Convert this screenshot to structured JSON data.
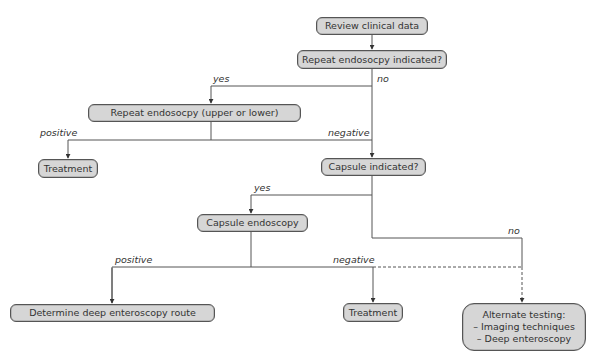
{
  "nodes": {
    "review": "Review clinical data",
    "repeat_indicated": "Repeat endosocpy indicated?",
    "repeat_endoscopy": "Repeat endosocpy (upper or lower)",
    "treatment_1": "Treatment",
    "capsule_indicated": "Capsule indicated?",
    "capsule_endoscopy": "Capsule endoscopy",
    "determine_route": "Determine deep enteroscopy route",
    "treatment_2": "Treatment",
    "alternate": {
      "title": "Alternate testing:",
      "items": [
        "– Imaging techniques",
        "– Deep enteroscopy"
      ]
    }
  },
  "edge_labels": {
    "yes_1": "yes",
    "no_1": "no",
    "positive_1": "positive",
    "negative_1": "negative",
    "yes_2": "yes",
    "no_2": "no",
    "positive_2": "positive",
    "negative_2": "negative"
  },
  "colors": {
    "node_fill": "#d6d6d6",
    "node_border": "#555555",
    "line": "#555555",
    "text": "#333333"
  }
}
